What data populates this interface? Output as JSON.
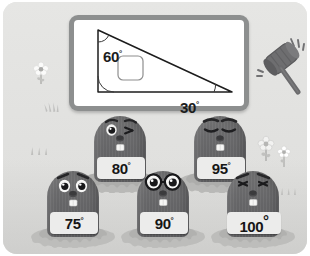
{
  "scene": {
    "title": "Angle quiz whack-a-mole illustration",
    "background_color": "#e3e3e1"
  },
  "whiteboard": {
    "name": "whiteboard",
    "frame_color": "#8d8f8f",
    "face_color": "#ffffff",
    "figure": "right-triangle",
    "angles": [
      {
        "label": "60",
        "degree_symbol": "°",
        "vertex": "top-left"
      },
      {
        "label": "30",
        "degree_symbol": "°",
        "vertex": "bottom-right"
      }
    ],
    "unknown_angle_box": {
      "label": "",
      "vertex": "bottom-left",
      "marker": "right-angle-square"
    }
  },
  "mallet": {
    "name": "mallet-icon",
    "motion_lines": true,
    "head_color": "#6e6e70",
    "handle_color": "#6b6b6d"
  },
  "moles": [
    {
      "id": "mole-80",
      "value": "80",
      "degree": "°",
      "expression": "winking",
      "row": "back",
      "order": 1
    },
    {
      "id": "mole-95",
      "value": "95",
      "degree": "°",
      "expression": "eyes-closed",
      "row": "back",
      "order": 2
    },
    {
      "id": "mole-75",
      "value": "75",
      "degree": "°",
      "expression": "wide-eyed",
      "row": "front",
      "order": 1
    },
    {
      "id": "mole-90",
      "value": "90",
      "degree": "°",
      "expression": "glasses",
      "row": "front",
      "order": 2
    },
    {
      "id": "mole-100",
      "value": "100",
      "degree": "°",
      "expression": "squinting",
      "row": "front",
      "order": 3
    }
  ],
  "decorations": {
    "flower_left": "flower-icon",
    "grass_left": "grass-icon",
    "flowers_right": [
      "flower-icon",
      "flower-icon"
    ],
    "sparkles_left": "sparkle-icon",
    "sparkles_right": "sparkle-icon"
  },
  "colors": {
    "mole_body": "#656567",
    "plaque": "#ececeb",
    "mound": "#b9b9b7",
    "text": "#161616"
  }
}
